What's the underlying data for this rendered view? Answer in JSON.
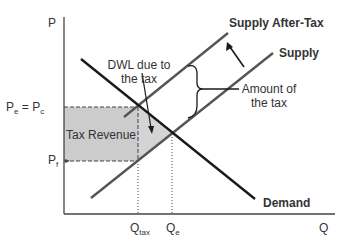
{
  "diagram": {
    "axes": {
      "y_label": "P",
      "x_label": "Q"
    },
    "curves": {
      "supply_after_tax": "Supply After-Tax",
      "supply": "Supply",
      "demand": "Demand"
    },
    "annotations": {
      "dwl_line1": "DWL due to",
      "dwl_line2": "the tax",
      "amount_line1": "Amount of",
      "amount_line2": "the tax",
      "tax_revenue": "Tax Revenue"
    },
    "price_labels": {
      "pe_main": "P",
      "pe_sub": "e",
      "eq": " = ",
      "pc_main": "P",
      "pc_sub": "c",
      "pf_main": "P",
      "pf_sub": "f"
    },
    "quantity_labels": {
      "qtax_main": "Q",
      "qtax_sub": "tax",
      "qe_main": "Q",
      "qe_sub": "e"
    },
    "colors": {
      "demand": "#1a1a1a",
      "supply": "#555555",
      "axis": "#444444",
      "tax_revenue_fill": "#cccccc",
      "dwl_fill": "#d4d4d4"
    }
  }
}
